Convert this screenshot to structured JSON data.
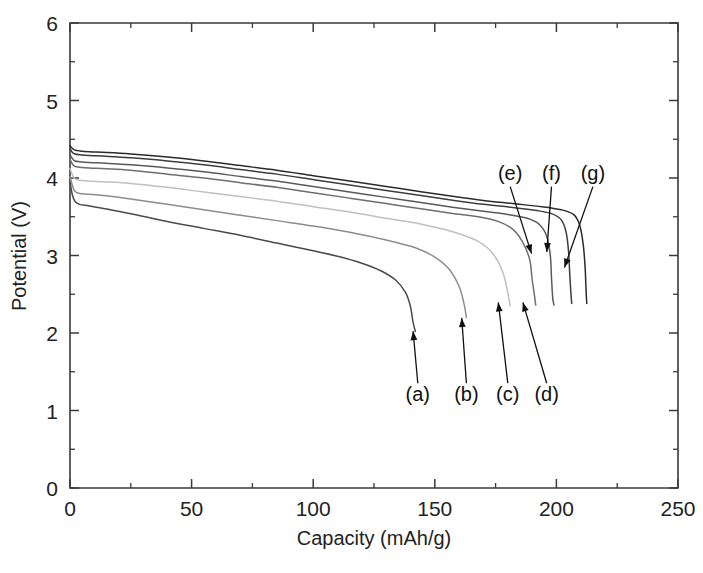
{
  "chart_data": {
    "type": "line",
    "title": "",
    "xlabel": "Capacity (mAh/g)",
    "ylabel": "Potential (V)",
    "xlim": [
      0,
      250
    ],
    "ylim": [
      0,
      6
    ],
    "xticks": [
      0,
      50,
      100,
      150,
      200,
      250
    ],
    "yticks": [
      0,
      1,
      2,
      3,
      4,
      5,
      6
    ],
    "xtick_labels": [
      "0",
      "50",
      "100",
      "150",
      "200",
      "250"
    ],
    "ytick_labels": [
      "0",
      "1",
      "2",
      "3",
      "4",
      "5",
      "6"
    ],
    "x_minor_tick_step": 25,
    "y_minor_tick_step": 0.5,
    "grid": false,
    "legend": "annotations",
    "annotations": [
      {
        "id": "a",
        "label": "(a)",
        "text_x": 143,
        "text_y": 1.12,
        "target_x": 141,
        "target_y": 2.05
      },
      {
        "id": "b",
        "label": "(b)",
        "text_x": 163,
        "text_y": 1.12,
        "target_x": 161,
        "target_y": 2.22
      },
      {
        "id": "c",
        "label": "(c)",
        "text_x": 180,
        "text_y": 1.12,
        "target_x": 176,
        "target_y": 2.42
      },
      {
        "id": "d",
        "label": "(d)",
        "text_x": 196,
        "text_y": 1.12,
        "target_x": 186,
        "target_y": 2.42
      },
      {
        "id": "e",
        "label": "(e)",
        "text_x": 181,
        "text_y": 3.98,
        "target_x": 190,
        "target_y": 3.0
      },
      {
        "id": "f",
        "label": "(f)",
        "text_x": 198,
        "text_y": 3.98,
        "target_x": 196,
        "target_y": 3.02
      },
      {
        "id": "g",
        "label": "(g)",
        "text_x": 215,
        "text_y": 3.98,
        "target_x": 203,
        "target_y": 2.82
      }
    ],
    "series": [
      {
        "name": "(a)",
        "color": "#4a4a4a",
        "points": [
          [
            0,
            3.95
          ],
          [
            1,
            3.78
          ],
          [
            2,
            3.7
          ],
          [
            4,
            3.66
          ],
          [
            8,
            3.64
          ],
          [
            15,
            3.6
          ],
          [
            25,
            3.54
          ],
          [
            40,
            3.44
          ],
          [
            55,
            3.35
          ],
          [
            70,
            3.26
          ],
          [
            85,
            3.16
          ],
          [
            100,
            3.06
          ],
          [
            110,
            2.99
          ],
          [
            120,
            2.9
          ],
          [
            128,
            2.8
          ],
          [
            134,
            2.68
          ],
          [
            138,
            2.52
          ],
          [
            140,
            2.34
          ],
          [
            141,
            2.15
          ],
          [
            142,
            2.02
          ]
        ]
      },
      {
        "name": "(b)",
        "color": "#8c8c8c",
        "points": [
          [
            0,
            4.02
          ],
          [
            1,
            3.9
          ],
          [
            2,
            3.83
          ],
          [
            4,
            3.8
          ],
          [
            8,
            3.79
          ],
          [
            15,
            3.77
          ],
          [
            25,
            3.73
          ],
          [
            40,
            3.66
          ],
          [
            55,
            3.59
          ],
          [
            70,
            3.52
          ],
          [
            85,
            3.45
          ],
          [
            100,
            3.38
          ],
          [
            115,
            3.3
          ],
          [
            130,
            3.2
          ],
          [
            142,
            3.1
          ],
          [
            150,
            2.98
          ],
          [
            156,
            2.82
          ],
          [
            160,
            2.6
          ],
          [
            162,
            2.38
          ],
          [
            163,
            2.2
          ]
        ]
      },
      {
        "name": "(c)",
        "color": "#c0c0c0",
        "points": [
          [
            0,
            4.12
          ],
          [
            1,
            4.04
          ],
          [
            2,
            3.99
          ],
          [
            4,
            3.97
          ],
          [
            8,
            3.96
          ],
          [
            15,
            3.95
          ],
          [
            25,
            3.93
          ],
          [
            40,
            3.88
          ],
          [
            55,
            3.82
          ],
          [
            70,
            3.76
          ],
          [
            85,
            3.7
          ],
          [
            100,
            3.63
          ],
          [
            115,
            3.56
          ],
          [
            130,
            3.48
          ],
          [
            145,
            3.4
          ],
          [
            158,
            3.3
          ],
          [
            168,
            3.18
          ],
          [
            174,
            3.02
          ],
          [
            178,
            2.78
          ],
          [
            180,
            2.52
          ],
          [
            181,
            2.35
          ]
        ]
      },
      {
        "name": "(d)",
        "color": "#6e6e6e",
        "points": [
          [
            0,
            4.24
          ],
          [
            1,
            4.18
          ],
          [
            2,
            4.15
          ],
          [
            4,
            4.14
          ],
          [
            8,
            4.13
          ],
          [
            15,
            4.12
          ],
          [
            25,
            4.1
          ],
          [
            40,
            4.05
          ],
          [
            55,
            4.0
          ],
          [
            70,
            3.94
          ],
          [
            85,
            3.88
          ],
          [
            100,
            3.81
          ],
          [
            115,
            3.74
          ],
          [
            130,
            3.67
          ],
          [
            145,
            3.6
          ],
          [
            158,
            3.54
          ],
          [
            168,
            3.5
          ],
          [
            176,
            3.44
          ],
          [
            182,
            3.34
          ],
          [
            186,
            3.18
          ],
          [
            189,
            2.95
          ],
          [
            190,
            2.7
          ],
          [
            191,
            2.48
          ],
          [
            191.5,
            2.36
          ]
        ]
      },
      {
        "name": "(e)",
        "color": "#5a5a5a",
        "points": [
          [
            0,
            4.3
          ],
          [
            1,
            4.25
          ],
          [
            2,
            4.22
          ],
          [
            4,
            4.21
          ],
          [
            8,
            4.2
          ],
          [
            15,
            4.19
          ],
          [
            25,
            4.17
          ],
          [
            40,
            4.13
          ],
          [
            55,
            4.08
          ],
          [
            70,
            4.02
          ],
          [
            85,
            3.96
          ],
          [
            100,
            3.89
          ],
          [
            115,
            3.82
          ],
          [
            130,
            3.75
          ],
          [
            145,
            3.68
          ],
          [
            158,
            3.62
          ],
          [
            170,
            3.57
          ],
          [
            180,
            3.53
          ],
          [
            188,
            3.48
          ],
          [
            193,
            3.4
          ],
          [
            196,
            3.25
          ],
          [
            197.5,
            3.0
          ],
          [
            198,
            2.7
          ],
          [
            198.5,
            2.45
          ],
          [
            199,
            2.36
          ]
        ]
      },
      {
        "name": "(f)",
        "color": "#3d3d3d",
        "points": [
          [
            0,
            4.38
          ],
          [
            1,
            4.33
          ],
          [
            2,
            4.31
          ],
          [
            4,
            4.3
          ],
          [
            8,
            4.29
          ],
          [
            15,
            4.28
          ],
          [
            25,
            4.26
          ],
          [
            40,
            4.22
          ],
          [
            55,
            4.17
          ],
          [
            70,
            4.11
          ],
          [
            85,
            4.05
          ],
          [
            100,
            3.98
          ],
          [
            115,
            3.91
          ],
          [
            130,
            3.84
          ],
          [
            145,
            3.77
          ],
          [
            158,
            3.71
          ],
          [
            170,
            3.66
          ],
          [
            182,
            3.62
          ],
          [
            192,
            3.58
          ],
          [
            198,
            3.54
          ],
          [
            202,
            3.46
          ],
          [
            204,
            3.3
          ],
          [
            205,
            3.05
          ],
          [
            205.5,
            2.75
          ],
          [
            206,
            2.5
          ],
          [
            206.3,
            2.38
          ]
        ]
      },
      {
        "name": "(g)",
        "color": "#2b2b2b",
        "points": [
          [
            0,
            4.42
          ],
          [
            1,
            4.38
          ],
          [
            2,
            4.36
          ],
          [
            4,
            4.35
          ],
          [
            8,
            4.34
          ],
          [
            15,
            4.33
          ],
          [
            25,
            4.31
          ],
          [
            40,
            4.27
          ],
          [
            55,
            4.22
          ],
          [
            70,
            4.16
          ],
          [
            85,
            4.1
          ],
          [
            100,
            4.03
          ],
          [
            115,
            3.96
          ],
          [
            130,
            3.89
          ],
          [
            145,
            3.82
          ],
          [
            158,
            3.76
          ],
          [
            170,
            3.71
          ],
          [
            182,
            3.67
          ],
          [
            194,
            3.63
          ],
          [
            202,
            3.59
          ],
          [
            207,
            3.53
          ],
          [
            209.5,
            3.4
          ],
          [
            211,
            3.15
          ],
          [
            211.8,
            2.85
          ],
          [
            212.2,
            2.55
          ],
          [
            212.5,
            2.38
          ]
        ]
      }
    ]
  },
  "axes": {
    "x_axis_name": "capacity-axis",
    "y_axis_name": "potential-axis"
  }
}
